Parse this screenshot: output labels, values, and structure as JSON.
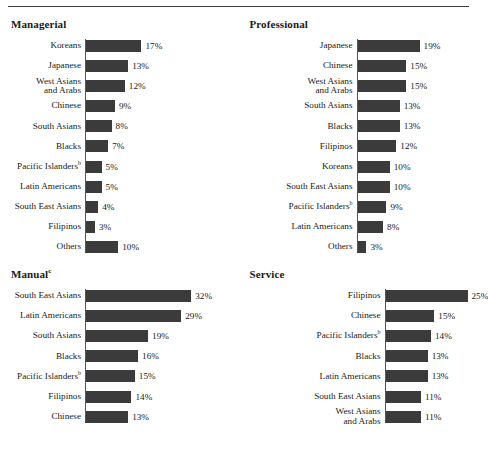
{
  "figure": {
    "rule_color": "#3a3a3a",
    "bar_color": "#3b3b3b",
    "axis_color": "#555555"
  },
  "chart_data": {
    "type": "bar",
    "title": "",
    "xlabel": "",
    "ylabel": "",
    "orientation": "horizontal",
    "grid": false,
    "legend": "none",
    "value_suffix": "%",
    "panels": [
      {
        "title": "Managerial",
        "title_superscript": "",
        "categories": [
          "Koreans",
          "Japanese",
          "West Asians\nand Arabs",
          "Chinese",
          "South Asians",
          "Blacks",
          "Pacific Islanders",
          "Latin Americans",
          "South East Asians",
          "Filipinos",
          "Others"
        ],
        "category_superscripts": [
          "",
          "",
          "",
          "",
          "",
          "",
          "b",
          "",
          "",
          "",
          ""
        ],
        "values": [
          17,
          13,
          12,
          9,
          8,
          7,
          5,
          5,
          4,
          3,
          10
        ],
        "labels": [
          "17%",
          "13%",
          "12%",
          "9%",
          "8%",
          "7%",
          "5%",
          "5%",
          "4%",
          "3%",
          "10%"
        ],
        "xlim": [
          0,
          32
        ]
      },
      {
        "title": "Professional",
        "title_superscript": "",
        "categories": [
          "Japanese",
          "Chinese",
          "West Asians\nand Arabs",
          "South Asians",
          "Blacks",
          "Filipinos",
          "Koreans",
          "South East Asians",
          "Pacific Islanders",
          "Latin Americans",
          "Others"
        ],
        "category_superscripts": [
          "",
          "",
          "",
          "",
          "",
          "",
          "",
          "",
          "b",
          "",
          ""
        ],
        "values": [
          19,
          15,
          15,
          13,
          13,
          12,
          10,
          10,
          9,
          8,
          3
        ],
        "labels": [
          "19%",
          "15%",
          "15%",
          "13%",
          "13%",
          "12%",
          "10%",
          "10%",
          "9%",
          "8%",
          "3%"
        ],
        "xlim": [
          0,
          32
        ]
      },
      {
        "title": "Manual",
        "title_superscript": "c",
        "categories": [
          "South East Asians",
          "Latin Americans",
          "South Asians",
          "Blacks",
          "Pacific Islanders",
          "Filipinos",
          "Chinese"
        ],
        "category_superscripts": [
          "",
          "",
          "",
          "",
          "b",
          "",
          ""
        ],
        "values": [
          32,
          29,
          19,
          16,
          15,
          14,
          13
        ],
        "labels": [
          "32%",
          "29%",
          "19%",
          "16%",
          "15%",
          "14%",
          "13%"
        ],
        "xlim": [
          0,
          32
        ]
      },
      {
        "title": "Service",
        "title_superscript": "",
        "categories": [
          "Filipinos",
          "Chinese",
          "Pacific Islanders",
          "Blacks",
          "Latin Americans",
          "South East Asians",
          "West Asians\nand Arabs"
        ],
        "category_superscripts": [
          "",
          "",
          "b",
          "",
          "",
          "",
          ""
        ],
        "values": [
          25,
          15,
          14,
          13,
          13,
          11,
          11
        ],
        "labels": [
          "25%",
          "15%",
          "14%",
          "13%",
          "13%",
          "11%",
          "11%"
        ],
        "xlim": [
          0,
          32
        ]
      }
    ]
  }
}
